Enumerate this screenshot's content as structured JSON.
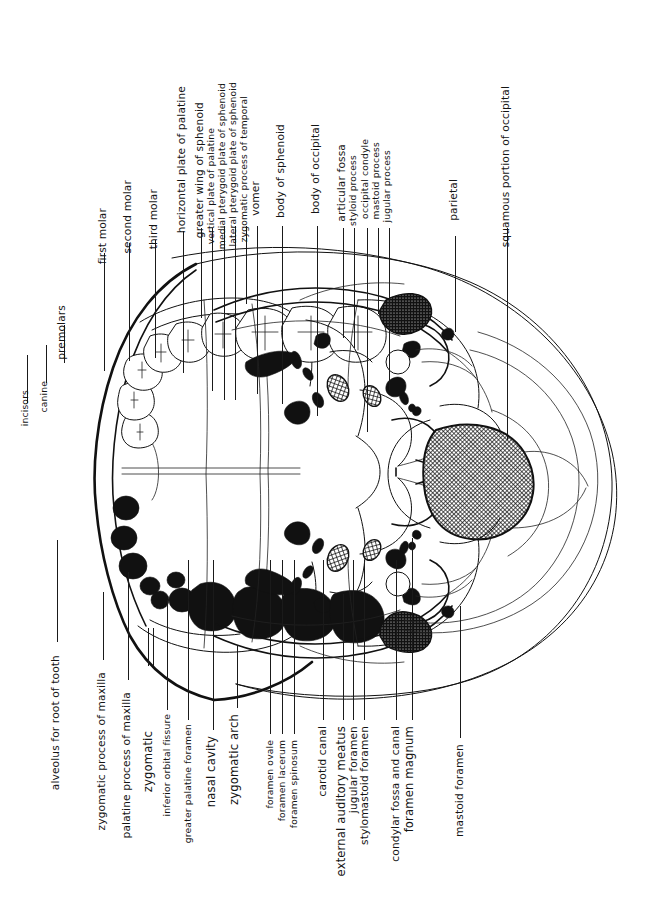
{
  "figure": {
    "kind": "anatomical-illustration",
    "orientation": "labels rotated 90 degrees counter-clockwise",
    "style": "black-and-white line drawing with stippled and cross-hatched shading"
  },
  "labels_top": [
    {
      "id": "incisors",
      "text": "incisors"
    },
    {
      "id": "canine",
      "text": "canine"
    },
    {
      "id": "premolars",
      "text": "premolars"
    },
    {
      "id": "first-molar",
      "text": "first molar"
    },
    {
      "id": "second-molar",
      "text": "second molar"
    },
    {
      "id": "third-molar",
      "text": "third molar"
    },
    {
      "id": "horizontal-plate-of-palatine",
      "text": "horizontal plate of palatine"
    },
    {
      "id": "greater-wing-of-sphenoid",
      "text": "greater wing of sphenoid"
    },
    {
      "id": "vertical-plate-of-palatine",
      "text": "vertical plate of palatine"
    },
    {
      "id": "medial-pterygoid-plate-of-sphenoid",
      "text": "medial pterygoid plate of sphenoid"
    },
    {
      "id": "lateral-pterygoid-plate-of-sphenoid",
      "text": "lateral pterygoid plate of sphenoid"
    },
    {
      "id": "zygomatic-process-of-temporal",
      "text": "zygomatic process of temporal"
    },
    {
      "id": "vomer",
      "text": "vomer"
    },
    {
      "id": "body-of-sphenoid",
      "text": "body of sphenoid"
    },
    {
      "id": "body-of-occipital",
      "text": "body of occipital"
    },
    {
      "id": "articular-fossa",
      "text": "articular fossa"
    },
    {
      "id": "styloid-process",
      "text": "styloid process"
    },
    {
      "id": "occipital-condyle",
      "text": "occipital condyle"
    },
    {
      "id": "mastoid-process",
      "text": "mastoid process"
    },
    {
      "id": "jugular-process",
      "text": "jugular process"
    },
    {
      "id": "parietal",
      "text": "parietal"
    },
    {
      "id": "squamous-portion-of-occipital",
      "text": "squamous portion of occipital"
    }
  ],
  "labels_bottom": [
    {
      "id": "alveolus-for-root-of-tooth",
      "text": "alveolus for root of tooth"
    },
    {
      "id": "zygomatic-process-of-maxilla",
      "text": "zygomatic process of maxilla"
    },
    {
      "id": "palatine-process-of-maxilla",
      "text": "palatine process of maxilla"
    },
    {
      "id": "zygomatic",
      "text": "zygomatic"
    },
    {
      "id": "inferior-orbital-fissure",
      "text": "inferior orbital fissure"
    },
    {
      "id": "greater-palatine-foramen",
      "text": "greater palatine foramen"
    },
    {
      "id": "nasal-cavity",
      "text": "nasal cavity"
    },
    {
      "id": "zygomatic-arch",
      "text": "zygomatic arch"
    },
    {
      "id": "foramen-ovale",
      "text": "foramen ovale"
    },
    {
      "id": "foramen-lacerum",
      "text": "foramen lacerum"
    },
    {
      "id": "foramen-spinosum",
      "text": "foramen spinosum"
    },
    {
      "id": "carotid-canal",
      "text": "carotid canal"
    },
    {
      "id": "external-auditory-meatus",
      "text": "external auditory meatus"
    },
    {
      "id": "jugular-foramen",
      "text": "jugular foramen"
    },
    {
      "id": "stylomastoid-foramen",
      "text": "stylomastoid foramen"
    },
    {
      "id": "condylar-fossa-and-canal",
      "text": "condylar fossa and canal"
    },
    {
      "id": "foramen-magnum",
      "text": "foramen magnum"
    },
    {
      "id": "mastoid-foramen",
      "text": "mastoid foramen"
    }
  ],
  "colors": {
    "ink": "#111111",
    "paper": "#ffffff"
  }
}
